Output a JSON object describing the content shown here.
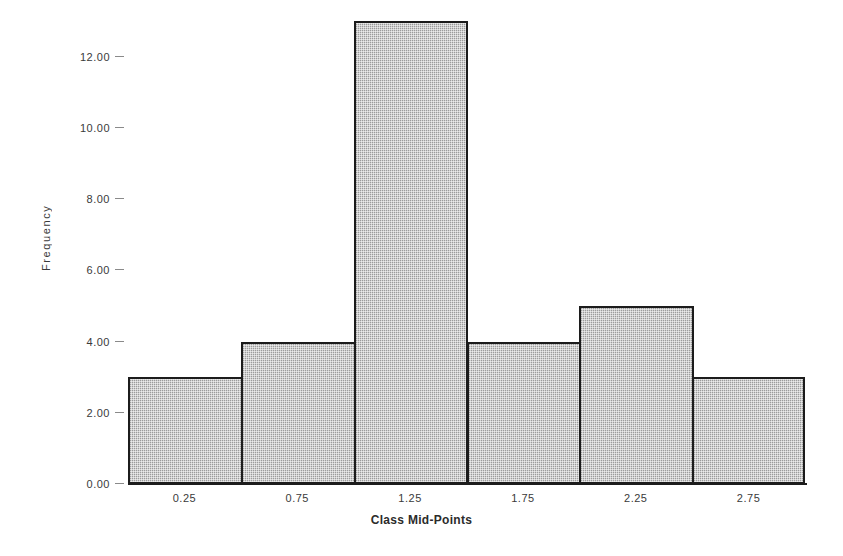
{
  "chart_data": {
    "type": "bar",
    "title": "",
    "subtitle": "",
    "xlabel": "Class Mid-Points",
    "ylabel": "Frequency",
    "categories": [
      "0.25",
      "0.75",
      "1.25",
      "1.75",
      "2.25",
      "2.75"
    ],
    "values": [
      3,
      4,
      13,
      4,
      5,
      3
    ],
    "ylim": [
      0,
      13
    ],
    "xlim": [
      0,
      3
    ],
    "yticks": [
      0,
      2,
      4,
      6,
      8,
      10,
      12
    ],
    "ytick_labels": [
      "0.00",
      "2.00",
      "4.00",
      "6.00",
      "8.00",
      "10.00",
      "12.00"
    ],
    "xtick_labels": [
      "0.25",
      "0.75",
      "1.25",
      "1.75",
      "2.25",
      "2.75"
    ],
    "grid": false,
    "legend": null,
    "bar_fill_color": "#b9b9b9",
    "bar_edge_color": "#1c1c1c",
    "background_color": "#ffffff",
    "text_color": "#3a3a3a",
    "class_width": 0.5,
    "bars": [
      {
        "midpoint": "0.25",
        "frequency": 3
      },
      {
        "midpoint": "0.75",
        "frequency": 4
      },
      {
        "midpoint": "1.25",
        "frequency": 13
      },
      {
        "midpoint": "1.75",
        "frequency": 4
      },
      {
        "midpoint": "2.25",
        "frequency": 5
      },
      {
        "midpoint": "2.75",
        "frequency": 3
      }
    ]
  }
}
